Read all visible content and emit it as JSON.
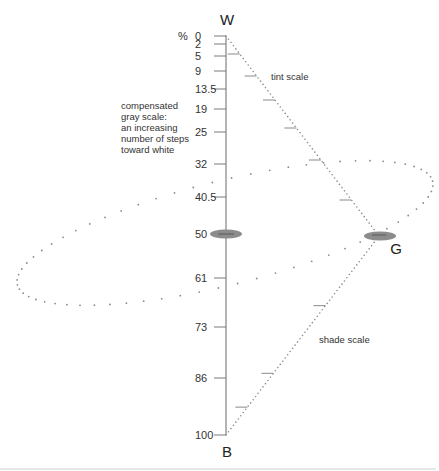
{
  "diagram": {
    "percent_symbol": "%",
    "poles": {
      "white": "W",
      "black": "B",
      "gray": "G"
    },
    "gray_scale_ticks": [
      "0",
      "2",
      "5",
      "9",
      "13.5",
      "19",
      "25",
      "32",
      "40.5",
      "50",
      "61",
      "73",
      "86",
      "100"
    ],
    "gray_scale_values": [
      0,
      2,
      5,
      9,
      13.5,
      19,
      25,
      32,
      40.5,
      50,
      61,
      73,
      86,
      100
    ],
    "annotation_lines": [
      "compensated",
      "gray scale:",
      "an increasing",
      "number of steps",
      "toward white"
    ],
    "tint_scale_label": "tint scale",
    "shade_scale_label": "shade scale",
    "tint_scale_steps": 6,
    "shade_scale_steps": 3,
    "colors": {
      "axis": "#6b6b6b",
      "dots": "#8a8a8a",
      "marker": "#8c8c8c",
      "text": "#333333",
      "bottom_rule": "#cfcfcf"
    }
  }
}
